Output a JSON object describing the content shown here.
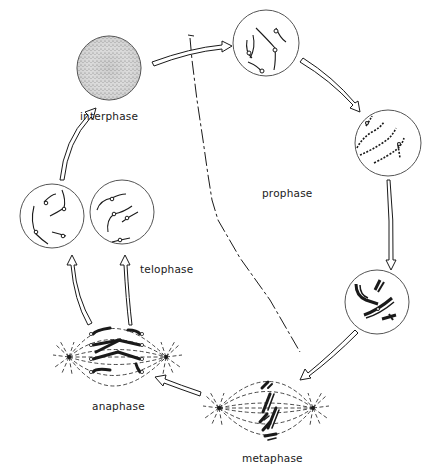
{
  "diagram": {
    "background": "#ffffff",
    "ink_color": "#1a1a1a",
    "stages": [
      {
        "id": "interphase",
        "label": "interphase"
      },
      {
        "id": "prophase",
        "label": "prophase"
      },
      {
        "id": "metaphase",
        "label": "metaphase"
      },
      {
        "id": "anaphase",
        "label": "anaphase"
      },
      {
        "id": "telophase",
        "label": "telophase"
      }
    ],
    "cycle_order": [
      "interphase",
      "prophase (early)",
      "prophase (mid)",
      "prophase (late)",
      "metaphase",
      "anaphase",
      "telophase",
      "interphase"
    ]
  }
}
